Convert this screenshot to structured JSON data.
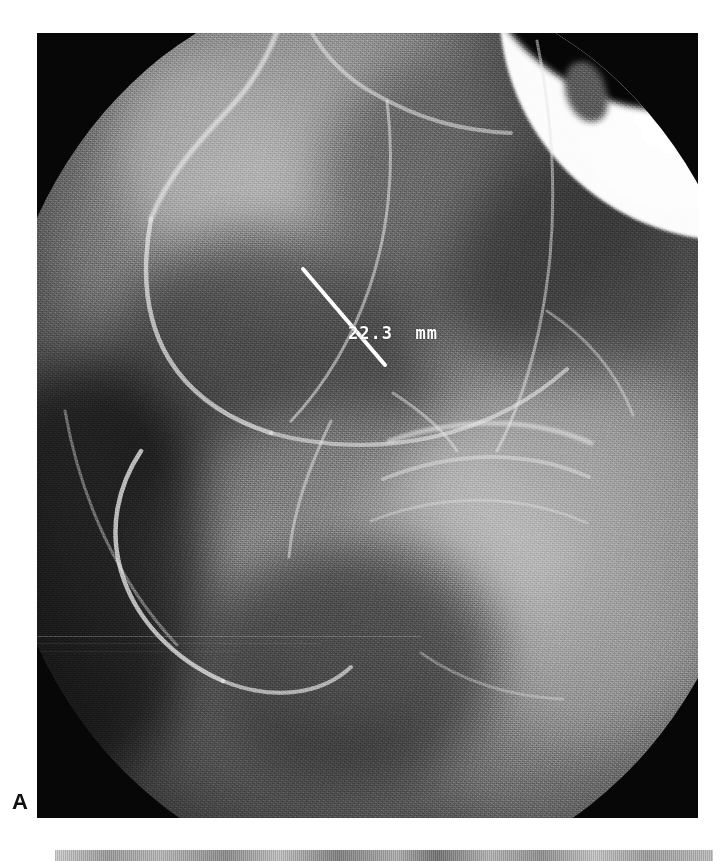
{
  "figure": {
    "panels": [
      {
        "letter": "A",
        "modality": "fluoroscopic radiograph",
        "annotation": {
          "measurement_text": "22.3  mm",
          "value": 22.3,
          "unit": "mm",
          "color": "#ffffff",
          "caliper_line": {
            "x1": 266,
            "y1": 236,
            "x2": 348,
            "y2": 332,
            "stroke": "#ffffff",
            "stroke_width": 4
          },
          "label_position": {
            "x": 311,
            "y": 290
          }
        }
      },
      {
        "letter": "B",
        "modality": "radiograph",
        "annotation": null
      }
    ],
    "background_color": "#ffffff",
    "field_shape": "circular-collimated",
    "image_tone": "grayscale"
  }
}
